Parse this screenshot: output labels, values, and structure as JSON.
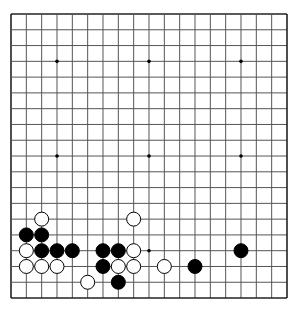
{
  "game": "go",
  "board": {
    "size": 19,
    "origin": {
      "x": 11,
      "y": 14
    },
    "step": {
      "x": 15.333,
      "y": 15.78
    },
    "background": "#ffffff",
    "line_color": "#555555",
    "border_color": "#222222",
    "star_points": [
      [
        3,
        3
      ],
      [
        9,
        3
      ],
      [
        15,
        3
      ],
      [
        3,
        9
      ],
      [
        9,
        9
      ],
      [
        15,
        9
      ],
      [
        3,
        15
      ],
      [
        9,
        15
      ],
      [
        15,
        15
      ]
    ]
  },
  "stones": {
    "black": [
      [
        1,
        14
      ],
      [
        2,
        14
      ],
      [
        2,
        15
      ],
      [
        3,
        15
      ],
      [
        4,
        15
      ],
      [
        6,
        15
      ],
      [
        7,
        15
      ],
      [
        15,
        15
      ],
      [
        6,
        16
      ],
      [
        12,
        16
      ],
      [
        7,
        17
      ]
    ],
    "white": [
      [
        2,
        13
      ],
      [
        8,
        13
      ],
      [
        1,
        15
      ],
      [
        8,
        15
      ],
      [
        1,
        16
      ],
      [
        2,
        16
      ],
      [
        3,
        16
      ],
      [
        7,
        16
      ],
      [
        8,
        16
      ],
      [
        10,
        16
      ],
      [
        5,
        17
      ]
    ]
  },
  "stone_style": {
    "black_fill": "#000000",
    "white_fill": "#ffffff",
    "outline": "#000000",
    "radius": 7
  }
}
